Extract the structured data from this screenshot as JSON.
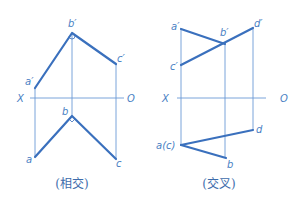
{
  "colors": {
    "thin_line": "#6b9ad6",
    "thick_line": "#3a70bd",
    "label": "#4a7fc4",
    "caption": "#3d6cab",
    "background": "#ffffff"
  },
  "diagrams": [
    {
      "id": "intersecting",
      "caption": "(相交)",
      "axis": {
        "x_label": "X",
        "o_label": "O"
      },
      "labels": {
        "a_prime": "a′",
        "b_prime": "b′",
        "c_prime": "c′",
        "a": "a",
        "b": "b",
        "c": "c"
      }
    },
    {
      "id": "crossing",
      "caption": "(交叉)",
      "axis": {
        "x_label": "X",
        "o_label": "O"
      },
      "labels": {
        "a_prime": "a′",
        "b_prime": "b′",
        "c_prime": "c′",
        "d_prime": "d′",
        "ac": "a(c)",
        "b": "b",
        "d": "d"
      }
    }
  ]
}
